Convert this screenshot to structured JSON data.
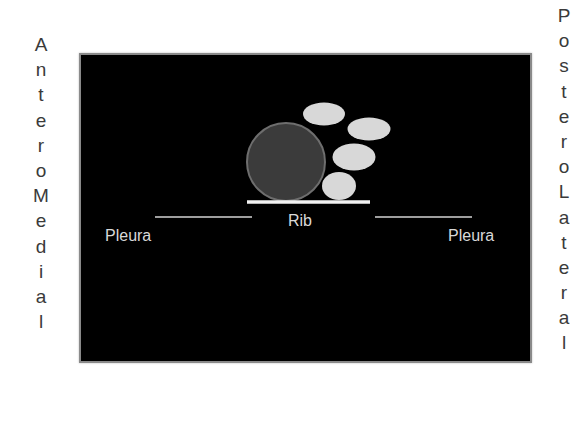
{
  "labels": {
    "left_vertical": "AnteroMedial",
    "right_vertical": "PosteroLateral",
    "rib": "Rib",
    "pleura_left": "Pleura",
    "pleura_right": "Pleura"
  },
  "colors": {
    "panel_background": "#000000",
    "panel_border": "#8a8a8a",
    "circle_fill": "#3b3b3b",
    "circle_stroke": "#6e6e6e",
    "ellipse_fill": "#d8d8d8",
    "rib_line": "#f2f2f2",
    "pleura_line": "#9e9e9e",
    "text": "#d9d9d9",
    "outer_text": "#3a3a3a"
  },
  "shapes": {
    "circle": {
      "cx": 205,
      "cy": 107,
      "r": 39
    },
    "ellipses": [
      {
        "cx": 243,
        "cy": 59,
        "rx": 21,
        "ry": 11.5
      },
      {
        "cx": 288,
        "cy": 74,
        "rx": 21.5,
        "ry": 11.5
      },
      {
        "cx": 273,
        "cy": 102,
        "rx": 21.5,
        "ry": 13.5
      },
      {
        "cx": 258,
        "cy": 131,
        "rx": 17,
        "ry": 14
      }
    ],
    "rib_line": {
      "x1": 166,
      "x2": 289,
      "y": 147,
      "width": 3.5
    },
    "pleura_left_line": {
      "x1": 74,
      "x2": 171,
      "y": 162,
      "width": 2
    },
    "pleura_right_line": {
      "x1": 294,
      "x2": 391,
      "y": 162,
      "width": 2
    }
  }
}
